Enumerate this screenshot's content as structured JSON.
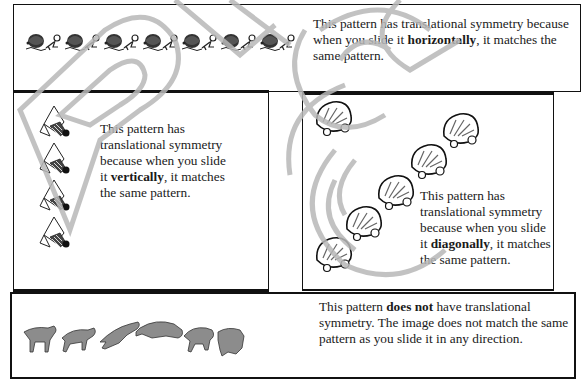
{
  "panels": [
    {
      "id": "horizontal",
      "pattern_icon": "horizontal-fish-border-pattern",
      "text_before": "This pattern has translational symmetry because when you slide it ",
      "emphasis": "horizontally",
      "text_after": ", it matches the same pattern."
    },
    {
      "id": "vertical",
      "pattern_icon": "vertical-bird-column-pattern",
      "text_before": "This pattern has translational symmetry because when you slide it ",
      "emphasis": "vertically",
      "text_after": ", it matches the same pattern."
    },
    {
      "id": "diagonal",
      "pattern_icon": "diagonal-seashell-pattern",
      "text_before": "This pattern has translational symmetry because when you slide it ",
      "emphasis": "diagonally",
      "text_after": ", it matches the same pattern."
    },
    {
      "id": "none",
      "pattern_icon": "saber-tooth-cat-sequence",
      "text_before": "This pattern ",
      "emphasis": "does not",
      "text_after": " have translational symmetry.  The image does not match the same pattern as you slide it in any direction."
    }
  ],
  "colors": {
    "border": "#111111",
    "text": "#1a1a1a",
    "watermark": "#b8b8b8",
    "cat_fill": "#8c8c8c"
  }
}
